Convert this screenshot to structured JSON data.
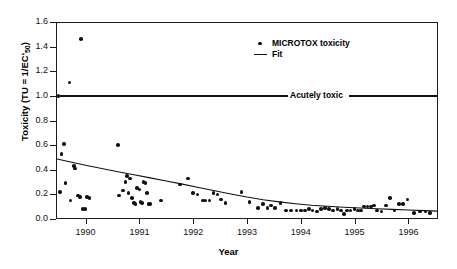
{
  "chart_data": {
    "type": "scatter",
    "title": "",
    "xlabel": "Year",
    "ylabel": "Toxicity (TU = 1/EC'50)",
    "ylabel_html": "Toxicity (TU = 1/EC'<sub>50</sub>)",
    "xlim": [
      1989.45,
      1996.55
    ],
    "ylim": [
      0.0,
      1.6
    ],
    "xticks": [
      1990,
      1991,
      1992,
      1993,
      1994,
      1995,
      1996
    ],
    "xticklabels": [
      "1990",
      "1991",
      "1992",
      "1993",
      "1994",
      "1995",
      "1996"
    ],
    "yticks": [
      0.0,
      0.2,
      0.4,
      0.6,
      0.8,
      1.0,
      1.2,
      1.4,
      1.6
    ],
    "yticklabels": [
      "0.0",
      "0.2",
      "0.4",
      "0.6",
      "0.8",
      "1.0",
      "1.2",
      "1.4",
      "1.6"
    ],
    "grid": false,
    "legend_position": "top-center",
    "legend": [
      {
        "label": "MICROTOX toxicity",
        "marker": "dot",
        "color": "#111111"
      },
      {
        "label": "Fit",
        "marker": "line",
        "color": "#111111"
      }
    ],
    "annotations": [
      {
        "text": "Acutely toxic",
        "y": 1.0,
        "type": "threshold-line",
        "line_color": "#111111",
        "line_width": 2
      }
    ],
    "series": [
      {
        "name": "MICROTOX toxicity",
        "marker": "dot",
        "color": "#111111",
        "points": [
          [
            1989.5,
            1.0
          ],
          [
            1989.7,
            1.11
          ],
          [
            1989.92,
            1.46
          ],
          [
            1989.52,
            0.22
          ],
          [
            1989.55,
            0.53
          ],
          [
            1989.6,
            0.61
          ],
          [
            1989.63,
            0.29
          ],
          [
            1989.72,
            0.15
          ],
          [
            1989.78,
            0.43
          ],
          [
            1989.8,
            0.41
          ],
          [
            1989.86,
            0.19
          ],
          [
            1989.9,
            0.18
          ],
          [
            1989.95,
            0.08
          ],
          [
            1990.0,
            0.08
          ],
          [
            1990.03,
            0.18
          ],
          [
            1990.07,
            0.17
          ],
          [
            1990.6,
            0.6
          ],
          [
            1990.62,
            0.19
          ],
          [
            1990.7,
            0.23
          ],
          [
            1990.74,
            0.3
          ],
          [
            1990.77,
            0.35
          ],
          [
            1990.8,
            0.21
          ],
          [
            1990.83,
            0.33
          ],
          [
            1990.86,
            0.17
          ],
          [
            1990.9,
            0.13
          ],
          [
            1990.93,
            0.12
          ],
          [
            1990.96,
            0.25
          ],
          [
            1991.0,
            0.24
          ],
          [
            1991.02,
            0.14
          ],
          [
            1991.05,
            0.13
          ],
          [
            1991.08,
            0.3
          ],
          [
            1991.11,
            0.29
          ],
          [
            1991.14,
            0.21
          ],
          [
            1991.17,
            0.12
          ],
          [
            1991.2,
            0.12
          ],
          [
            1991.4,
            0.15
          ],
          [
            1991.75,
            0.28
          ],
          [
            1991.9,
            0.33
          ],
          [
            1992.0,
            0.21
          ],
          [
            1992.08,
            0.2
          ],
          [
            1992.18,
            0.15
          ],
          [
            1992.23,
            0.15
          ],
          [
            1992.3,
            0.15
          ],
          [
            1992.38,
            0.21
          ],
          [
            1992.45,
            0.2
          ],
          [
            1992.52,
            0.16
          ],
          [
            1992.6,
            0.13
          ],
          [
            1992.9,
            0.22
          ],
          [
            1993.05,
            0.14
          ],
          [
            1993.2,
            0.09
          ],
          [
            1993.3,
            0.12
          ],
          [
            1993.38,
            0.09
          ],
          [
            1993.45,
            0.11
          ],
          [
            1993.52,
            0.09
          ],
          [
            1993.62,
            0.13
          ],
          [
            1993.72,
            0.07
          ],
          [
            1993.82,
            0.07
          ],
          [
            1993.92,
            0.07
          ],
          [
            1994.0,
            0.07
          ],
          [
            1994.08,
            0.07
          ],
          [
            1994.15,
            0.08
          ],
          [
            1994.22,
            0.07
          ],
          [
            1994.3,
            0.06
          ],
          [
            1994.38,
            0.08
          ],
          [
            1994.45,
            0.09
          ],
          [
            1994.52,
            0.08
          ],
          [
            1994.6,
            0.07
          ],
          [
            1994.68,
            0.08
          ],
          [
            1994.75,
            0.07
          ],
          [
            1994.8,
            0.04
          ],
          [
            1994.86,
            0.07
          ],
          [
            1994.92,
            0.07
          ],
          [
            1995.0,
            0.08
          ],
          [
            1995.06,
            0.07
          ],
          [
            1995.12,
            0.07
          ],
          [
            1995.18,
            0.1
          ],
          [
            1995.24,
            0.1
          ],
          [
            1995.3,
            0.1
          ],
          [
            1995.36,
            0.11
          ],
          [
            1995.42,
            0.07
          ],
          [
            1995.5,
            0.06
          ],
          [
            1995.58,
            0.11
          ],
          [
            1995.66,
            0.17
          ],
          [
            1995.74,
            0.07
          ],
          [
            1995.82,
            0.12
          ],
          [
            1995.9,
            0.12
          ],
          [
            1995.98,
            0.16
          ],
          [
            1996.1,
            0.05
          ],
          [
            1996.22,
            0.06
          ],
          [
            1996.32,
            0.06
          ],
          [
            1996.4,
            0.05
          ]
        ]
      }
    ],
    "fit": {
      "name": "Fit",
      "color": "#111111",
      "points": [
        [
          1989.45,
          0.49
        ],
        [
          1989.7,
          0.465
        ],
        [
          1990.0,
          0.437
        ],
        [
          1990.3,
          0.41
        ],
        [
          1990.6,
          0.384
        ],
        [
          1990.9,
          0.359
        ],
        [
          1991.2,
          0.334
        ],
        [
          1991.5,
          0.309
        ],
        [
          1991.8,
          0.283
        ],
        [
          1992.1,
          0.256
        ],
        [
          1992.4,
          0.229
        ],
        [
          1992.7,
          0.203
        ],
        [
          1993.0,
          0.178
        ],
        [
          1993.3,
          0.157
        ],
        [
          1993.6,
          0.139
        ],
        [
          1993.9,
          0.124
        ],
        [
          1994.2,
          0.112
        ],
        [
          1994.5,
          0.103
        ],
        [
          1994.8,
          0.095
        ],
        [
          1995.1,
          0.089
        ],
        [
          1995.4,
          0.083
        ],
        [
          1995.7,
          0.078
        ],
        [
          1996.0,
          0.073
        ],
        [
          1996.3,
          0.068
        ],
        [
          1996.55,
          0.064
        ]
      ]
    }
  }
}
